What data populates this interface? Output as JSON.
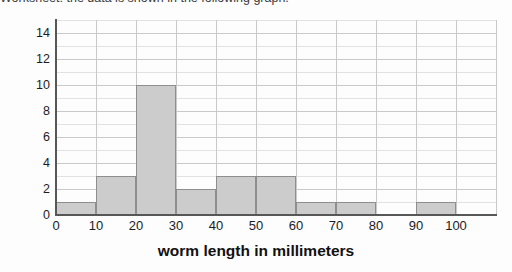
{
  "scan": {
    "top_cut_text": "Worksheet: the data is shown in the following graph."
  },
  "chart_data": {
    "type": "bar",
    "title": "",
    "xlabel": "worm length in millimeters",
    "ylabel": "",
    "categories": [
      "0-10",
      "10-20",
      "20-30",
      "30-40",
      "40-50",
      "50-60",
      "60-70",
      "70-80",
      "80-90",
      "90-100"
    ],
    "bin_edges": [
      0,
      10,
      20,
      30,
      40,
      50,
      60,
      70,
      80,
      90,
      100
    ],
    "values": [
      1,
      3,
      10,
      2,
      3,
      3,
      1,
      1,
      0,
      1
    ],
    "xlim": [
      0,
      110
    ],
    "ylim": [
      0,
      15
    ],
    "x_ticks": [
      "0",
      "10",
      "20",
      "30",
      "40",
      "50",
      "60",
      "70",
      "80",
      "90",
      "100"
    ],
    "x_tick_values": [
      0,
      10,
      20,
      30,
      40,
      50,
      60,
      70,
      80,
      90,
      100
    ],
    "y_ticks": [
      "0",
      "2",
      "4",
      "6",
      "8",
      "10",
      "12",
      "14"
    ],
    "y_tick_values": [
      0,
      2,
      4,
      6,
      8,
      10,
      12,
      14
    ],
    "y_minor_step": 1,
    "grid": true,
    "legend": "none",
    "bar_fill": "#cccccc",
    "bar_stroke": "#8e8e8e",
    "axis_color": "#575757",
    "gridline_major": "#c9c9c9",
    "gridline_minor": "#e2e2e2"
  }
}
